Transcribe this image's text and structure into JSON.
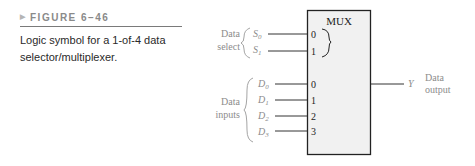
{
  "caption": {
    "figure_label": "FIGURE 6–46",
    "text": "Logic symbol for a 1-of-4 data selector/multiplexer."
  },
  "mux": {
    "title": "MUX",
    "select_group_label": [
      "Data",
      "select"
    ],
    "select_inputs": [
      {
        "name": "S",
        "sub": "0",
        "pin": "0"
      },
      {
        "name": "S",
        "sub": "1",
        "pin": "1"
      }
    ],
    "data_group_label": [
      "Data",
      "inputs"
    ],
    "data_inputs": [
      {
        "name": "D",
        "sub": "0",
        "pin": "0"
      },
      {
        "name": "D",
        "sub": "1",
        "pin": "1"
      },
      {
        "name": "D",
        "sub": "2",
        "pin": "2"
      },
      {
        "name": "D",
        "sub": "3",
        "pin": "3"
      }
    ],
    "output": {
      "name": "Y",
      "label": [
        "Data",
        "output"
      ]
    }
  },
  "colors": {
    "box_fill": "#f1f1f1",
    "box_stroke": "#222222",
    "label_gray": "#8c8c8c",
    "pin_text": "#222222"
  }
}
